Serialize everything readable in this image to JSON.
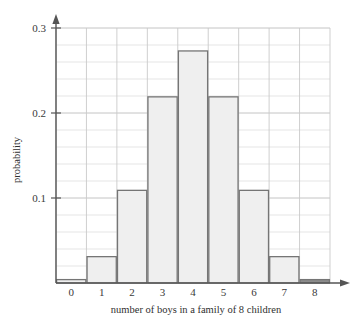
{
  "chart_data": {
    "type": "bar",
    "title": "",
    "xlabel": "number of boys in a family of 8 children",
    "ylabel": "probability",
    "categories": [
      "0",
      "1",
      "2",
      "3",
      "4",
      "5",
      "6",
      "7",
      "8"
    ],
    "values": [
      0.004,
      0.031,
      0.109,
      0.219,
      0.273,
      0.219,
      0.109,
      0.031,
      0.004
    ],
    "ylim": [
      0,
      0.3
    ],
    "xlim": [
      -0.5,
      8.5
    ],
    "y_ticks": [
      "0.1",
      "0.2",
      "0.3"
    ],
    "y_tick_values": [
      0.1,
      0.2,
      0.3
    ],
    "y_minor_step": 0.02,
    "x_ticks": [
      "0",
      "1",
      "2",
      "3",
      "4",
      "5",
      "6",
      "7",
      "8"
    ],
    "grid": true,
    "legend": "none",
    "bar_fill_color": "#efefef",
    "bar_edge_color": "#757575",
    "last_bar_fill_color": "#8c8c8c",
    "grid_color": "#d8d8d8",
    "axis_color": "#555555"
  },
  "axes": {
    "y_label": "probability",
    "x_label": "number of boys in a family of 8 children"
  }
}
